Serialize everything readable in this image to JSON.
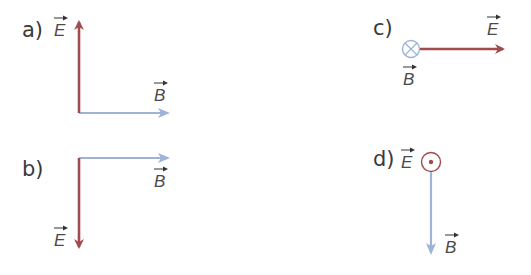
{
  "colors": {
    "E_field": "#a14a50",
    "B_field": "#9fb3d6",
    "label_text": "#3a3a3a"
  },
  "panels": [
    {
      "id": "a",
      "label": "a)",
      "E": {
        "symbol": "E",
        "direction": "up"
      },
      "B": {
        "symbol": "B",
        "direction": "right"
      }
    },
    {
      "id": "b",
      "label": "b)",
      "E": {
        "symbol": "E",
        "direction": "down"
      },
      "B": {
        "symbol": "B",
        "direction": "right"
      }
    },
    {
      "id": "c",
      "label": "c)",
      "E": {
        "symbol": "E",
        "direction": "right"
      },
      "B": {
        "symbol": "B",
        "direction": "into-page",
        "glyph": "⊗"
      }
    },
    {
      "id": "d",
      "label": "d)",
      "E": {
        "symbol": "E",
        "direction": "out-of-page",
        "glyph": "⊙"
      },
      "B": {
        "symbol": "B",
        "direction": "down"
      }
    }
  ]
}
